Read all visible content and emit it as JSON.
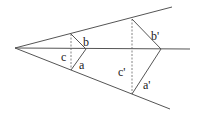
{
  "diagram": {
    "colors": {
      "line": "#555555",
      "dashed": "#666666",
      "text": "#222222",
      "background": "#ffffff"
    },
    "apex": {
      "x": 15,
      "y": 48
    },
    "rays": [
      {
        "name": "upper-ray",
        "x2": 172,
        "y2": 7
      },
      {
        "name": "middle-ray",
        "x2": 190,
        "y2": 49
      },
      {
        "name": "lower-ray",
        "x2": 170,
        "y2": 109
      }
    ],
    "small_triangle": {
      "top": {
        "x": 71,
        "y": 34
      },
      "bottom": {
        "x": 71,
        "y": 70
      },
      "vertex": {
        "x": 86,
        "y": 49
      },
      "labels": {
        "b": {
          "text": "b",
          "x": 83,
          "y": 46
        },
        "c": {
          "text": "c",
          "x": 61,
          "y": 61
        },
        "a": {
          "text": "a",
          "x": 79,
          "y": 69
        }
      }
    },
    "large_triangle": {
      "top": {
        "x": 132,
        "y": 19
      },
      "bottom": {
        "x": 132,
        "y": 94
      },
      "vertex": {
        "x": 161,
        "y": 49
      },
      "labels": {
        "b_prime": {
          "text": "b'",
          "x": 151,
          "y": 40
        },
        "c_prime": {
          "text": "c'",
          "x": 118,
          "y": 76
        },
        "a_prime": {
          "text": "a'",
          "x": 143,
          "y": 89
        }
      }
    }
  }
}
